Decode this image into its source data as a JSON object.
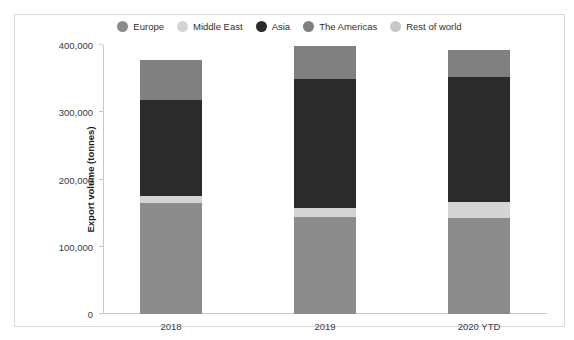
{
  "chart_data": {
    "type": "bar",
    "subtype": "stacked-vertical",
    "title": "",
    "xlabel": "Year ended December",
    "ylabel": "Export volume (tonnes)",
    "categories": [
      "2018",
      "2019",
      "2020 YTD"
    ],
    "ylim": [
      0,
      400000
    ],
    "yticks": [
      0,
      100000,
      200000,
      300000,
      400000
    ],
    "ytick_labels": [
      "0",
      "100,000",
      "200,000",
      "300,000",
      "400,000"
    ],
    "grid": false,
    "legend_position": "top-center",
    "series": [
      {
        "name": "Europe",
        "color": "#8c8c8c",
        "values": [
          165000,
          145000,
          143000
        ]
      },
      {
        "name": "Middle East",
        "color": "#d4d4d4",
        "values": [
          11000,
          13000,
          23000
        ]
      },
      {
        "name": "Asia",
        "color": "#2b2b2b",
        "values": [
          142000,
          192000,
          187000
        ]
      },
      {
        "name": "The Americas",
        "color": "#808080",
        "values": [
          60000,
          48000,
          39000
        ]
      },
      {
        "name": "Rest of world",
        "color": "#c8c8c8",
        "values": [
          0,
          0,
          0
        ]
      }
    ],
    "totals": [
      378000,
      398000,
      392000
    ]
  },
  "legend": {
    "items": [
      {
        "label": "Europe",
        "color": "#8c8c8c"
      },
      {
        "label": "Middle East",
        "color": "#d4d4d4"
      },
      {
        "label": "Asia",
        "color": "#2b2b2b"
      },
      {
        "label": "The Americas",
        "color": "#808080"
      },
      {
        "label": "Rest of world",
        "color": "#c8c8c8"
      }
    ]
  }
}
